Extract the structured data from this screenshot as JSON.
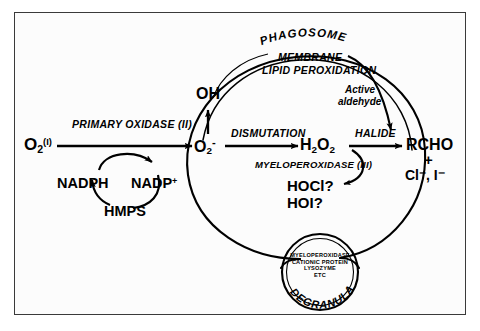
{
  "diagram": {
    "frame_border_color": "#3a3a3a",
    "background_color": "#fcfcfc",
    "line_color": "#000000",
    "compartments": {
      "phagosome_label": "PHAGOSOME",
      "membrane_label_line1": "MEMBRANE",
      "membrane_label_line2": "LIPID PEROXIDATION",
      "degranulation_label": "DEGRANULATION"
    },
    "granule": {
      "contents": [
        "MYELOPEROXIDASE",
        "CATIONIC PROTEIN",
        "LYSOZYME",
        "ETC"
      ]
    },
    "species": {
      "oxygen_input": {
        "base": "O",
        "subscript": "2",
        "superscript": "(I)"
      },
      "superoxide": {
        "base": "O",
        "subscript": "2",
        "superscript": "-"
      },
      "hydroxyl_radical": "OH",
      "hydrogen_peroxide": {
        "base": "H",
        "sub1": "2",
        "mid": "O",
        "sub2": "2"
      },
      "aldehyde": "RCHO",
      "plus_sign": "+",
      "halide_ions": "Cl⁻, I⁻",
      "hypochlorous": "HOCl?",
      "hypoiodous": "HOI?",
      "nadph": "NADPH",
      "nadp_plus": {
        "base": "NADP",
        "superscript": "+"
      },
      "hmps": "HMPS"
    },
    "reactions": {
      "primary_oxidase": "PRIMARY OXIDASE (II)",
      "dismutation": "DISMUTATION",
      "halide": "HALIDE",
      "myeloperoxidase": "MYELOPEROXIDASE (III)",
      "active_aldehyde_line1": "Active",
      "active_aldehyde_line2": "aldehyde"
    }
  }
}
